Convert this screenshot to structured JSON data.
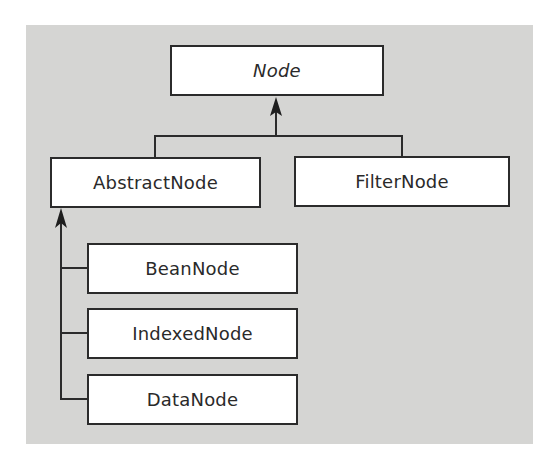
{
  "diagram": {
    "type": "class-hierarchy",
    "root": {
      "label": "Node",
      "italic": true
    },
    "level1": [
      {
        "label": "AbstractNode",
        "parent": "Node"
      },
      {
        "label": "FilterNode",
        "parent": "Node"
      }
    ],
    "level2": [
      {
        "label": "BeanNode",
        "parent": "AbstractNode"
      },
      {
        "label": "IndexedNode",
        "parent": "AbstractNode"
      },
      {
        "label": "DataNode",
        "parent": "AbstractNode"
      }
    ],
    "colors": {
      "panel": "#d5d5d3",
      "box_fill": "#ffffff",
      "line": "#2b2b2b"
    }
  }
}
